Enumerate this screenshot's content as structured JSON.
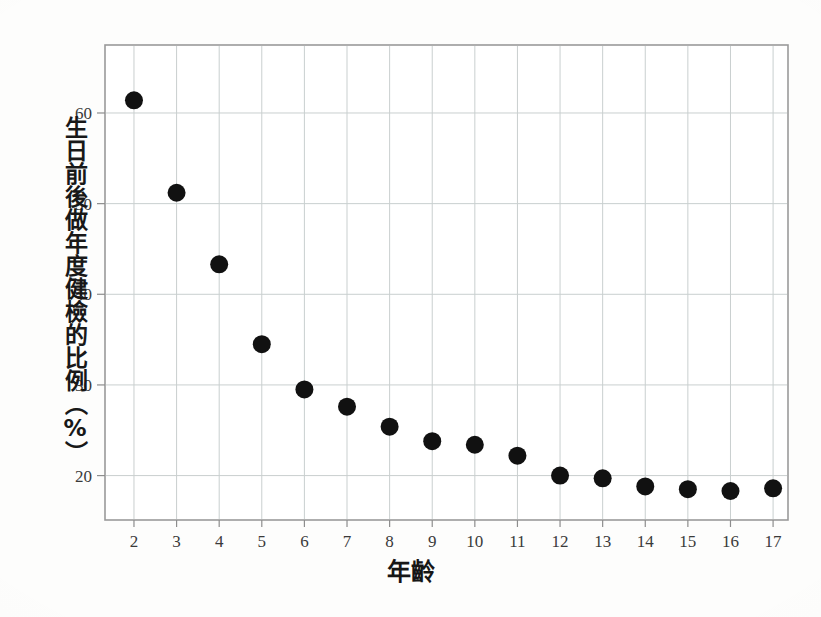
{
  "chart_data": {
    "type": "scatter",
    "title": "",
    "subtitle": "",
    "xlabel": "年齡",
    "ylabel": "生日前後做年度健檢的比例（%）",
    "x": [
      2,
      3,
      4,
      5,
      6,
      7,
      8,
      9,
      10,
      11,
      12,
      13,
      14,
      15,
      16,
      17
    ],
    "values": [
      61.4,
      51.2,
      43.3,
      34.5,
      29.5,
      27.6,
      25.4,
      23.8,
      23.4,
      22.2,
      20.0,
      19.7,
      18.8,
      18.5,
      18.3,
      18.6
    ],
    "series": [
      {
        "name": "生日前後做年度健檢的比例",
        "values": [
          61.4,
          51.2,
          43.3,
          34.5,
          29.5,
          27.6,
          25.4,
          23.8,
          23.4,
          22.2,
          20.0,
          19.7,
          18.8,
          18.5,
          18.3,
          18.6
        ]
      }
    ],
    "points": [
      {
        "x": 2,
        "y": 61.4
      },
      {
        "x": 3,
        "y": 51.2
      },
      {
        "x": 4,
        "y": 43.3
      },
      {
        "x": 5,
        "y": 34.5
      },
      {
        "x": 6,
        "y": 29.5
      },
      {
        "x": 7,
        "y": 27.6
      },
      {
        "x": 8,
        "y": 25.4
      },
      {
        "x": 9,
        "y": 23.8
      },
      {
        "x": 10,
        "y": 23.4
      },
      {
        "x": 11,
        "y": 22.2
      },
      {
        "x": 12,
        "y": 20.0
      },
      {
        "x": 13,
        "y": 19.7
      },
      {
        "x": 14,
        "y": 18.8
      },
      {
        "x": 15,
        "y": 18.5
      },
      {
        "x": 16,
        "y": 18.3
      },
      {
        "x": 17,
        "y": 18.6
      }
    ],
    "xtick_labels": [
      "2",
      "3",
      "4",
      "5",
      "6",
      "7",
      "8",
      "9",
      "10",
      "11",
      "12",
      "13",
      "14",
      "15",
      "16",
      "17"
    ],
    "ytick_labels": [
      "20",
      "30",
      "40",
      "50",
      "60"
    ],
    "yticks": [
      20,
      30,
      40,
      50,
      60
    ],
    "xlim": [
      1.32,
      17.35
    ],
    "ylim": [
      15.1,
      67.5
    ],
    "grid": true,
    "grid_axis": "both",
    "legend": null,
    "legend_position": "none",
    "marker": "filled-circle",
    "marker_color": "#111111",
    "marker_radius_px": 9,
    "grid_color": "#c9cfcf",
    "frame_color": "#9a9a9a",
    "background_color": "#fdfdfc",
    "annotations": []
  },
  "axes": {
    "y_title": "生日前後做年度健檢的比例（%）",
    "x_title": "年齡"
  }
}
